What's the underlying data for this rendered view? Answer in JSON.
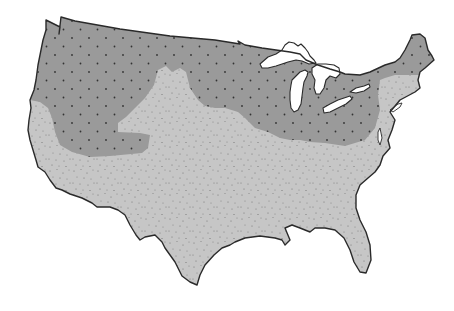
{
  "map": {
    "subject": "Contiguous United States",
    "style": "grayscale, no labels",
    "background_color": "#ffffff",
    "outline_color": "#2a2a2a",
    "regions": [
      {
        "id": "northern-zone",
        "description": "Darker gray zone with regular dot grid: Pacific Northwest, northern Rockies, northern plains, upper Midwest, Great Lakes states, Pennsylvania and New York",
        "fill_color": "#9a9a9a",
        "pattern": "regular-dots",
        "dot_color": "#333333"
      },
      {
        "id": "southern-zone",
        "description": "Lighter gray stippled zone: southern states, California coast, central plains tongue extending north, and New England",
        "fill_color": "#c6c6c6",
        "pattern": "random-stipple",
        "dot_color": "#6e6e6e"
      }
    ],
    "water_features": [
      {
        "id": "great-lakes",
        "fill_color": "#ffffff"
      }
    ],
    "labels": [],
    "legend": null
  }
}
